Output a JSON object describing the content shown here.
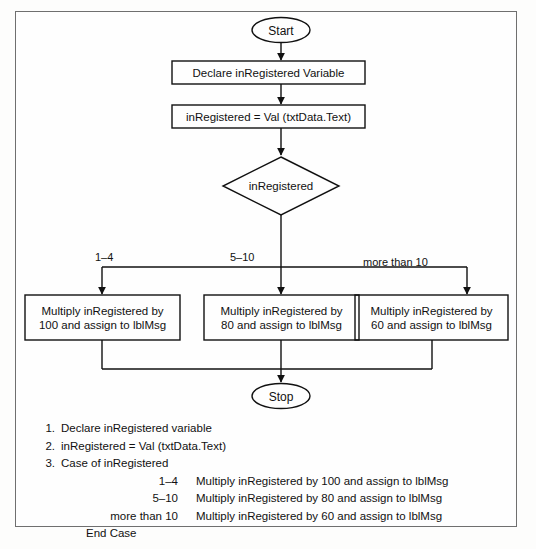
{
  "document": {
    "kind": "flowchart-with-pseudocode",
    "title": "Case of inRegistered flowchart"
  },
  "flowchart": {
    "start": {
      "label": "Start",
      "shape": "terminator"
    },
    "declare": {
      "label": "Declare inRegistered Variable",
      "shape": "process"
    },
    "assign": {
      "label": "inRegistered = Val (txtData.Text)",
      "shape": "process"
    },
    "decision": {
      "label": "inRegistered",
      "shape": "decision"
    },
    "branches": [
      {
        "label": "1–4",
        "action": "Multiply inRegistered by\n100 and assign to lblMsg"
      },
      {
        "label": "5–10",
        "action": "Multiply inRegistered by\n80 and assign to lblMsg"
      },
      {
        "label": "more than 10",
        "action": "Multiply inRegistered by\n60 and assign to lblMsg"
      }
    ],
    "stop": {
      "label": "Stop",
      "shape": "terminator"
    }
  },
  "pseudocode": {
    "steps": [
      {
        "number": "1.",
        "text": "Declare inRegistered variable"
      },
      {
        "number": "2.",
        "text": "inRegistered = Val (txtData.Text)"
      },
      {
        "number": "3.",
        "text": "Case of inRegistered"
      }
    ],
    "cases": [
      {
        "key": "1–4",
        "value": "Multiply inRegistered by 100 and assign to lblMsg"
      },
      {
        "key": "5–10",
        "value": "Multiply inRegistered by 80 and assign to lblMsg"
      },
      {
        "key": "more than 10",
        "value": "Multiply inRegistered by 60 and assign to lblMsg"
      }
    ],
    "end": "End Case"
  },
  "colors": {
    "ink": "#111111",
    "frame": "#6f6f6f",
    "paper": "#fefefe"
  }
}
